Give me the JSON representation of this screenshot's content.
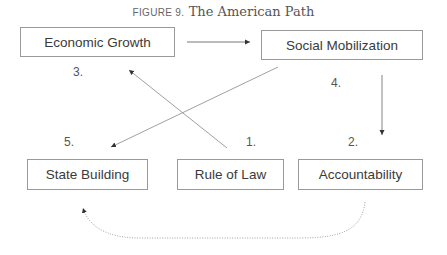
{
  "figure": {
    "label": "FIGURE 9.",
    "title": "The American Path"
  },
  "nodes": [
    {
      "id": "economic-growth",
      "label": "Economic Growth",
      "step": "3."
    },
    {
      "id": "social-mobilization",
      "label": "Social Mobilization",
      "step": "4."
    },
    {
      "id": "state-building",
      "label": "State Building",
      "step": "5."
    },
    {
      "id": "rule-of-law",
      "label": "Rule of Law",
      "step": "1."
    },
    {
      "id": "accountability",
      "label": "Accountability",
      "step": "2."
    }
  ],
  "edges": [
    {
      "from": "economic-growth",
      "to": "social-mobilization",
      "style": "solid"
    },
    {
      "from": "social-mobilization",
      "to": "accountability",
      "style": "solid"
    },
    {
      "from": "rule-of-law",
      "to": "economic-growth",
      "style": "solid"
    },
    {
      "from": "social-mobilization",
      "to": "state-building",
      "style": "solid"
    },
    {
      "from": "accountability",
      "to": "state-building",
      "style": "dotted"
    }
  ],
  "colors": {
    "box_border": "#9a9a9a",
    "text": "#3a3a3a",
    "edge": "#777777"
  }
}
